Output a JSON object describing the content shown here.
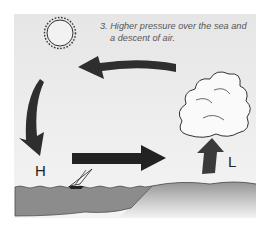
{
  "diagram": {
    "caption_lines": [
      "3. Higher pressure over the sea and",
      "a descent of air."
    ],
    "labels": {
      "high": "H",
      "low": "L"
    },
    "elements": [
      "sun",
      "cloud",
      "sea",
      "land",
      "sailboat",
      "arrow-upper-left",
      "arrow-down-left",
      "arrow-right-surface",
      "arrow-up-rising"
    ],
    "colors": {
      "background": "#e9e9e9",
      "arrow": "#2e2e2e",
      "sea": "#8a8a8a",
      "land": "#a8a8a8",
      "text": "#555555"
    }
  }
}
